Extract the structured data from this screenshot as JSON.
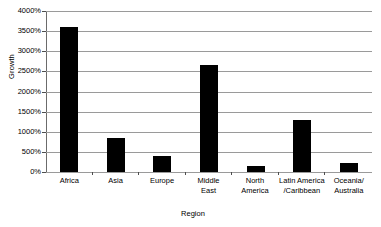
{
  "chart_data": {
    "type": "bar",
    "title": "",
    "xlabel": "Region",
    "ylabel": "Growth",
    "categories": [
      "Africa",
      "Asia",
      "Europe",
      "Middle East",
      "North America",
      "Latin America/Caribbean",
      "Oceania/Australia"
    ],
    "category_label_lines": [
      [
        "Africa"
      ],
      [
        "Asia"
      ],
      [
        "Europe"
      ],
      [
        "Middle",
        "East"
      ],
      [
        "North",
        "America"
      ],
      [
        "Latin America",
        "/Caribbean"
      ],
      [
        "Oceania/",
        "Australia"
      ]
    ],
    "values": [
      3600,
      840,
      400,
      2650,
      160,
      1300,
      230
    ],
    "value_unit": "%",
    "ylim": [
      0,
      4000
    ],
    "ytick_values": [
      0,
      500,
      1000,
      1500,
      2000,
      2500,
      3000,
      3500,
      4000
    ],
    "ytick_labels": [
      "0%",
      "500%",
      "1000%",
      "1500%",
      "2000%",
      "2500%",
      "3000%",
      "3500%",
      "4000%"
    ],
    "grid": true,
    "legend": false,
    "legend_position": "none",
    "bar_color": "#000000",
    "gridline_color": "#9a9a9a",
    "axis_color": "#4d4d4d",
    "background_color": "#ffffff"
  }
}
